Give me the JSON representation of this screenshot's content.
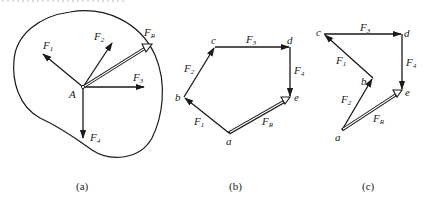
{
  "figure": {
    "panels": [
      {
        "id": "a",
        "caption": "(a)",
        "title": "Concurrent forces acting at point A on a rigid body",
        "point_label": "A",
        "forces": [
          {
            "name": "F",
            "sub": "1",
            "direction": "up-left"
          },
          {
            "name": "F",
            "sub": "2",
            "direction": "up-right"
          },
          {
            "name": "F",
            "sub": "3",
            "direction": "right"
          },
          {
            "name": "F",
            "sub": "4",
            "direction": "down"
          },
          {
            "name": "F",
            "sub": "R",
            "direction": "resultant up-right",
            "style": "double-line"
          }
        ]
      },
      {
        "id": "b",
        "caption": "(b)",
        "title": "Force polygon (order F1, F2, F3, F4)",
        "vertices": [
          "a",
          "b",
          "c",
          "d",
          "e"
        ],
        "edges": [
          {
            "from": "a",
            "to": "b",
            "name": "F",
            "sub": "1"
          },
          {
            "from": "b",
            "to": "c",
            "name": "F",
            "sub": "2"
          },
          {
            "from": "c",
            "to": "d",
            "name": "F",
            "sub": "3"
          },
          {
            "from": "d",
            "to": "e",
            "name": "F",
            "sub": "4"
          },
          {
            "from": "a",
            "to": "e",
            "name": "F",
            "sub": "R",
            "style": "double-line"
          }
        ]
      },
      {
        "id": "c",
        "caption": "(c)",
        "title": "Force polygon (order F2, F1, F3, F4)",
        "vertices": [
          "a",
          "b",
          "c",
          "d",
          "e"
        ],
        "edges": [
          {
            "from": "a",
            "to": "b",
            "name": "F",
            "sub": "2"
          },
          {
            "from": "b",
            "to": "c",
            "name": "F",
            "sub": "1"
          },
          {
            "from": "c",
            "to": "d",
            "name": "F",
            "sub": "3"
          },
          {
            "from": "d",
            "to": "e",
            "name": "F",
            "sub": "4"
          },
          {
            "from": "a",
            "to": "e",
            "name": "F",
            "sub": "R",
            "style": "double-line"
          }
        ]
      }
    ]
  },
  "labels": {
    "a": {
      "A": "A",
      "F1": "F",
      "F1s": "1",
      "F2": "F",
      "F2s": "2",
      "F3": "F",
      "F3s": "3",
      "F4": "F",
      "F4s": "4",
      "FR": "F",
      "FRs": "R",
      "caption": "(a)"
    },
    "b": {
      "a": "a",
      "b": "b",
      "c": "c",
      "d": "d",
      "e": "e",
      "F1": "F",
      "F1s": "1",
      "F2": "F",
      "F2s": "2",
      "F3": "F",
      "F3s": "3",
      "F4": "F",
      "F4s": "4",
      "FR": "F",
      "FRs": "R",
      "caption": "(b)"
    },
    "c": {
      "a": "a",
      "b": "b",
      "c": "c",
      "d": "d",
      "e": "e",
      "F1": "F",
      "F1s": "1",
      "F2": "F",
      "F2s": "2",
      "F3": "F",
      "F3s": "3",
      "F4": "F",
      "F4s": "4",
      "FR": "F",
      "FRs": "R",
      "caption": "(c)"
    }
  },
  "colors": {
    "line": "#1a1a1a",
    "background": "#ffffff"
  }
}
